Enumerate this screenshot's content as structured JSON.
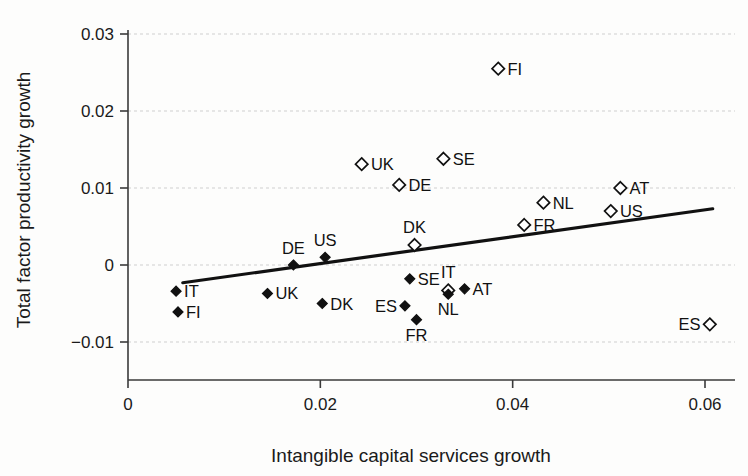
{
  "chart_data": {
    "type": "scatter",
    "title": "",
    "xlabel": "Intangible capital services growth",
    "ylabel": "Total factor productivity growth",
    "xlim": [
      0,
      0.065
    ],
    "ylim": [
      -0.012,
      0.032
    ],
    "xticks": [
      0,
      0.02,
      0.04,
      0.06
    ],
    "xtick_labels": [
      "0",
      "0.02",
      "0.04",
      "0.06"
    ],
    "yticks": [
      -0.01,
      0,
      0.01,
      0.02,
      0.03
    ],
    "ytick_labels": [
      "-0.01",
      "0",
      "0.01",
      "0.02",
      "0.03"
    ],
    "grid": "horizontal-dashed",
    "legend": "none",
    "series": [
      {
        "name": "open-diamond",
        "marker": "open-diamond",
        "points": [
          {
            "label": "FI",
            "x": 0.0385,
            "y": 0.0255,
            "label_side": "right"
          },
          {
            "label": "SE",
            "x": 0.0328,
            "y": 0.0138,
            "label_side": "right"
          },
          {
            "label": "UK",
            "x": 0.0243,
            "y": 0.0131,
            "label_side": "right"
          },
          {
            "label": "DE",
            "x": 0.0282,
            "y": 0.0104,
            "label_side": "right"
          },
          {
            "label": "AT",
            "x": 0.0512,
            "y": 0.01,
            "label_side": "right"
          },
          {
            "label": "NL",
            "x": 0.0432,
            "y": 0.0081,
            "label_side": "right"
          },
          {
            "label": "US",
            "x": 0.0502,
            "y": 0.007,
            "label_side": "right"
          },
          {
            "label": "FR",
            "x": 0.0412,
            "y": 0.0052,
            "label_side": "right"
          },
          {
            "label": "DK",
            "x": 0.0298,
            "y": 0.0026,
            "label_side": "above"
          },
          {
            "label": "IT",
            "x": 0.0333,
            "y": -0.0033,
            "label_side": "above"
          },
          {
            "label": "ES",
            "x": 0.0605,
            "y": -0.0077,
            "label_side": "left"
          }
        ]
      },
      {
        "name": "filled-diamond",
        "marker": "filled-diamond",
        "points": [
          {
            "label": "US",
            "x": 0.0205,
            "y": 0.001,
            "label_side": "above"
          },
          {
            "label": "DE",
            "x": 0.0172,
            "y": 0.0,
            "label_side": "above"
          },
          {
            "label": "SE",
            "x": 0.0293,
            "y": -0.0018,
            "label_side": "right"
          },
          {
            "label": "AT",
            "x": 0.035,
            "y": -0.0031,
            "label_side": "right"
          },
          {
            "label": "IT",
            "x": 0.005,
            "y": -0.0034,
            "label_side": "right"
          },
          {
            "label": "UK",
            "x": 0.0145,
            "y": -0.0037,
            "label_side": "right"
          },
          {
            "label": "NL",
            "x": 0.0333,
            "y": -0.0038,
            "label_side": "below"
          },
          {
            "label": "DK",
            "x": 0.0202,
            "y": -0.005,
            "label_side": "right"
          },
          {
            "label": "ES",
            "x": 0.0288,
            "y": -0.0053,
            "label_side": "left"
          },
          {
            "label": "FI",
            "x": 0.0052,
            "y": -0.0061,
            "label_side": "right"
          },
          {
            "label": "FR",
            "x": 0.03,
            "y": -0.0071,
            "label_side": "below"
          }
        ]
      }
    ],
    "fit_line": {
      "name": "regression-line",
      "x_start": 0.0057,
      "y_start": -0.0023,
      "x_end": 0.0608,
      "y_end": 0.0073
    }
  },
  "colors": {
    "marker_stroke": "#111111",
    "marker_fill_open": "#ffffff",
    "marker_fill_solid": "#111111",
    "fit_line": "#111111",
    "grid": "#cfcfcf",
    "axis": "#3a3a3a",
    "text": "#1a1a1a",
    "background": "#fdfdfc"
  }
}
